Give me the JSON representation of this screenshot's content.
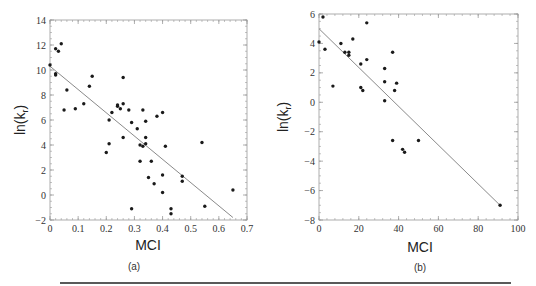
{
  "chart_data": [
    {
      "type": "scatter",
      "panel_label": "(a)",
      "xlabel": "MCI",
      "ylabel": "ln(k_r)",
      "xlim": [
        0,
        0.7
      ],
      "ylim": [
        -2,
        14
      ],
      "xticks": [
        "0",
        "0.1",
        "0.2",
        "0.3",
        "0.4",
        "0.5",
        "0.6",
        "0.7"
      ],
      "yticks": [
        "-2",
        "0",
        "2",
        "4",
        "6",
        "8",
        "10",
        "12",
        "14"
      ],
      "grid": false,
      "fit_line": {
        "x": [
          0,
          0.65
        ],
        "y": [
          10.3,
          -1.8
        ]
      },
      "points": [
        [
          0.0,
          10.4
        ],
        [
          0.02,
          11.7
        ],
        [
          0.03,
          11.5
        ],
        [
          0.04,
          12.1
        ],
        [
          0.02,
          9.7
        ],
        [
          0.02,
          9.6
        ],
        [
          0.06,
          8.4
        ],
        [
          0.05,
          6.8
        ],
        [
          0.09,
          6.9
        ],
        [
          0.12,
          7.3
        ],
        [
          0.14,
          8.7
        ],
        [
          0.15,
          9.5
        ],
        [
          0.21,
          6.0
        ],
        [
          0.22,
          6.6
        ],
        [
          0.24,
          7.1
        ],
        [
          0.24,
          7.2
        ],
        [
          0.25,
          6.9
        ],
        [
          0.26,
          9.4
        ],
        [
          0.26,
          7.3
        ],
        [
          0.28,
          6.8
        ],
        [
          0.29,
          5.8
        ],
        [
          0.31,
          5.3
        ],
        [
          0.33,
          6.8
        ],
        [
          0.34,
          5.9
        ],
        [
          0.38,
          6.3
        ],
        [
          0.4,
          6.6
        ],
        [
          0.2,
          3.4
        ],
        [
          0.21,
          4.1
        ],
        [
          0.26,
          4.6
        ],
        [
          0.32,
          4.0
        ],
        [
          0.33,
          3.9
        ],
        [
          0.34,
          4.6
        ],
        [
          0.34,
          4.1
        ],
        [
          0.41,
          3.9
        ],
        [
          0.32,
          2.7
        ],
        [
          0.36,
          2.7
        ],
        [
          0.35,
          1.4
        ],
        [
          0.37,
          0.9
        ],
        [
          0.4,
          1.6
        ],
        [
          0.4,
          0.2
        ],
        [
          0.47,
          1.5
        ],
        [
          0.47,
          1.1
        ],
        [
          0.29,
          -1.1
        ],
        [
          0.43,
          -1.1
        ],
        [
          0.43,
          -1.5
        ],
        [
          0.54,
          4.2
        ],
        [
          0.55,
          -0.9
        ],
        [
          0.65,
          0.4
        ]
      ]
    },
    {
      "type": "scatter",
      "panel_label": "(b)",
      "xlabel": "MCI",
      "ylabel": "ln(k_r)",
      "xlim": [
        0,
        100
      ],
      "ylim": [
        -8,
        6
      ],
      "xticks": [
        "0",
        "20",
        "40",
        "60",
        "80",
        "100"
      ],
      "yticks": [
        "-8",
        "-6",
        "-4",
        "-2",
        "0",
        "2",
        "4",
        "6"
      ],
      "grid": false,
      "fit_line": {
        "x": [
          0,
          91
        ],
        "y": [
          5.0,
          -7.0
        ]
      },
      "points": [
        [
          2,
          5.8
        ],
        [
          0,
          4.1
        ],
        [
          3,
          3.6
        ],
        [
          7,
          1.1
        ],
        [
          11,
          4.0
        ],
        [
          13,
          3.4
        ],
        [
          15,
          3.4
        ],
        [
          15,
          3.2
        ],
        [
          17,
          4.3
        ],
        [
          21,
          2.6
        ],
        [
          21,
          1.0
        ],
        [
          22,
          0.8
        ],
        [
          24,
          5.4
        ],
        [
          24,
          2.9
        ],
        [
          33,
          2.3
        ],
        [
          33,
          1.4
        ],
        [
          33,
          0.1
        ],
        [
          37,
          3.4
        ],
        [
          38,
          0.8
        ],
        [
          39,
          1.3
        ],
        [
          37,
          -2.6
        ],
        [
          42,
          -3.2
        ],
        [
          43,
          -3.4
        ],
        [
          50,
          -2.6
        ],
        [
          91,
          -7.0
        ]
      ]
    }
  ],
  "panels": {
    "a": {
      "caption": "(a)",
      "xlabel": "MCI",
      "ylabel_main": "ln(k",
      "ylabel_sub": "r",
      "ylabel_close": ")"
    },
    "b": {
      "caption": "(b)",
      "xlabel": "MCI",
      "ylabel_main": "ln(k",
      "ylabel_sub": "r",
      "ylabel_close": ")"
    }
  },
  "colors": {
    "points": "#1a1a1a",
    "fit_line": "#8a8a8a",
    "axes": "#9a9a9a",
    "rule": "#222222"
  }
}
